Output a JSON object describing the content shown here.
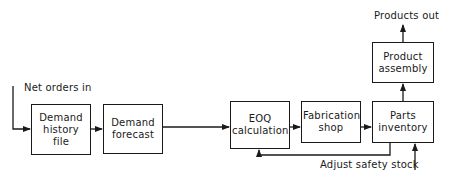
{
  "diagram": {
    "type": "flowchart",
    "nodes": [
      {
        "id": "demand_history",
        "label": "Demand history file"
      },
      {
        "id": "demand_forecast",
        "label": "Demand forecast"
      },
      {
        "id": "eoq",
        "label": "EOQ calculation"
      },
      {
        "id": "fabrication",
        "label": "Fabrication shop"
      },
      {
        "id": "parts_inventory",
        "label": "Parts inventory"
      },
      {
        "id": "product_assembly",
        "label": "Product assembly"
      }
    ],
    "labels": {
      "input": "Net orders in",
      "output": "Products out",
      "feedback": "Adjust safety stock"
    },
    "edges": [
      {
        "from": "input",
        "to": "demand_history"
      },
      {
        "from": "demand_history",
        "to": "demand_forecast"
      },
      {
        "from": "demand_forecast",
        "to": "eoq"
      },
      {
        "from": "eoq",
        "to": "fabrication"
      },
      {
        "from": "fabrication",
        "to": "parts_inventory"
      },
      {
        "from": "parts_inventory",
        "to": "product_assembly"
      },
      {
        "from": "product_assembly",
        "to": "output"
      },
      {
        "from": "parts_inventory",
        "to": "eoq",
        "kind": "feedback"
      },
      {
        "from": "adjust_safety_stock",
        "to": "parts_inventory"
      }
    ]
  }
}
